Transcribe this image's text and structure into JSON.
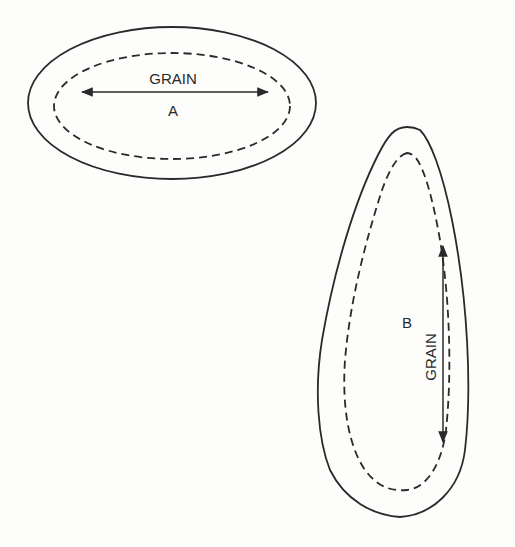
{
  "diagram": {
    "pieces": [
      {
        "id": "A",
        "label": "A",
        "grain_label": "GRAIN",
        "grain_direction": "horizontal"
      },
      {
        "id": "B",
        "label": "B",
        "grain_label": "GRAIN",
        "grain_direction": "vertical"
      }
    ],
    "legend": {
      "solid_line": "cutting line",
      "dashed_line": "seam line"
    },
    "colors": {
      "line": "#2a2a2a",
      "background": "#fdfdfc"
    }
  }
}
